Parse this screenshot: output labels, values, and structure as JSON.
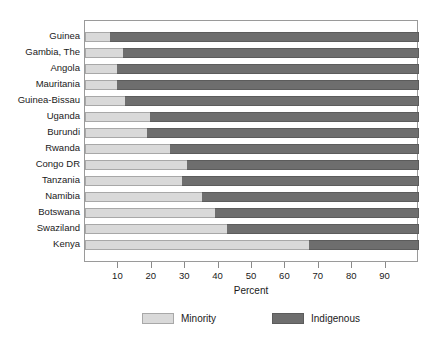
{
  "chart_data": {
    "type": "bar",
    "orientation": "horizontal",
    "stacked": true,
    "title": "",
    "xlabel": "Percent",
    "ylabel": "",
    "xlim": [
      0,
      100
    ],
    "xticks": [
      10,
      20,
      30,
      40,
      50,
      60,
      70,
      80,
      90
    ],
    "grid": false,
    "legend_position": "bottom",
    "categories": [
      "Guinea",
      "Gambia, The",
      "Angola",
      "Mauritania",
      "Guinea-Bissau",
      "Uganda",
      "Burundi",
      "Rwanda",
      "Congo DR",
      "Tanzania",
      "Namibia",
      "Botswana",
      "Swaziland",
      "Kenya"
    ],
    "series": [
      {
        "name": "Minority",
        "color": "#d9d9d9",
        "values": [
          7.5,
          11.5,
          9.5,
          9.5,
          12,
          19.5,
          18.5,
          25.5,
          30.5,
          29,
          35,
          39,
          42.5,
          67
        ]
      },
      {
        "name": "Indigenous",
        "color": "#6e6e6e",
        "values": [
          92.5,
          88.5,
          90.5,
          90.5,
          88,
          80.5,
          81.5,
          74.5,
          69.5,
          71,
          65,
          61,
          57.5,
          33
        ]
      }
    ]
  }
}
